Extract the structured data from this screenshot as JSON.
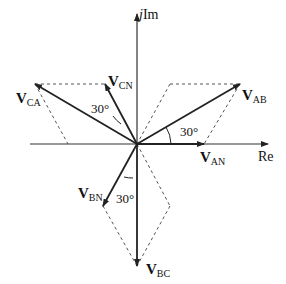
{
  "diagram": {
    "type": "phasor-diagram",
    "axes": {
      "real_label": "Re",
      "imag_label_j": "j",
      "imag_label": "Im"
    },
    "phasors": [
      {
        "id": "V_AN",
        "symbol": "V",
        "sub": "AN",
        "angle_deg": 0
      },
      {
        "id": "V_AB",
        "symbol": "V",
        "sub": "AB",
        "angle_deg": 30
      },
      {
        "id": "V_CN",
        "symbol": "V",
        "sub": "CN",
        "angle_deg": 120
      },
      {
        "id": "V_CA",
        "symbol": "V",
        "sub": "CA",
        "angle_deg": 150
      },
      {
        "id": "V_BN",
        "symbol": "V",
        "sub": "BN",
        "angle_deg": 240
      },
      {
        "id": "V_BC",
        "symbol": "V",
        "sub": "BC",
        "angle_deg": 270
      }
    ],
    "angles": [
      {
        "label": "30°",
        "between": "V_AN-V_AB"
      },
      {
        "label": "30°",
        "between": "V_CN-V_CA"
      },
      {
        "label": "30°",
        "between": "V_BN-V_BC"
      }
    ]
  }
}
